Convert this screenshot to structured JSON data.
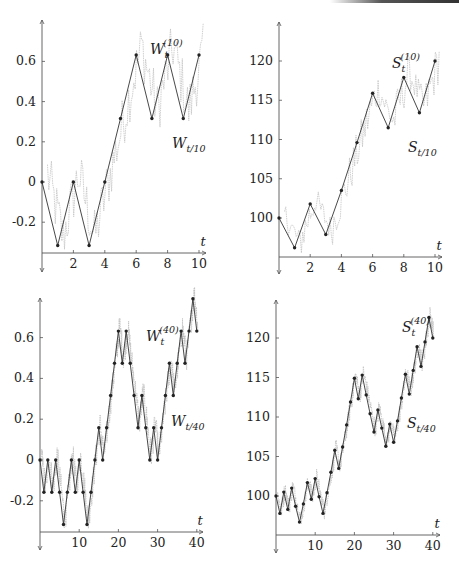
{
  "colors": {
    "axis": "#555555",
    "path": "#333333",
    "noise": "#bbbbbb",
    "marker": "#222222",
    "text": "#222222"
  },
  "chart_data": [
    {
      "id": "top-left",
      "type": "line",
      "title": "",
      "xlabel": "t",
      "ylabel": "",
      "xlim": [
        0,
        10
      ],
      "ylim": [
        -0.35,
        0.77
      ],
      "xticks": [
        2,
        4,
        6,
        8,
        10
      ],
      "xtick_labels": [
        "2",
        "4",
        "6",
        "8",
        "10"
      ],
      "yticks": [
        -0.2,
        0,
        0.2,
        0.4,
        0.6
      ],
      "ytick_labels": [
        "-0.2",
        "0",
        "0.2",
        "0.4",
        "0.6"
      ],
      "grid": false,
      "frame": {
        "x0": 42,
        "y0": 182,
        "xscale": 15.7,
        "yscale": 201,
        "axis_y": 253,
        "top": 20,
        "bottom": 272,
        "right": 206
      },
      "series": [
        {
          "name": "W_t^(10)",
          "label_main": "W",
          "label_sub": "t",
          "label_sup": "(10)",
          "label_pos": [
            150,
            54
          ],
          "x": [
            0,
            1,
            2,
            3,
            4,
            5,
            6,
            7,
            8,
            9,
            10
          ],
          "values": [
            0,
            -0.316,
            0,
            -0.316,
            0,
            0.316,
            0.632,
            0.316,
            0.632,
            0.316,
            0.632
          ]
        },
        {
          "name": "W_{t/10}",
          "label_main": "W",
          "label_sub": "t/10",
          "label_sup": "",
          "label_pos": [
            172,
            148
          ],
          "style": "noise"
        }
      ]
    },
    {
      "id": "top-right",
      "type": "line",
      "title": "",
      "xlabel": "t",
      "ylabel": "",
      "xlim": [
        0,
        10
      ],
      "ylim": [
        95,
        124
      ],
      "xticks": [
        2,
        4,
        6,
        8,
        10
      ],
      "xtick_labels": [
        "2",
        "4",
        "6",
        "8",
        "10"
      ],
      "yticks": [
        100,
        105,
        110,
        115,
        120
      ],
      "ytick_labels": [
        "100",
        "105",
        "110",
        "115",
        "120"
      ],
      "grid": false,
      "frame": {
        "x0": 279,
        "y0": 218,
        "xscale": 15.6,
        "yscale": 7.85,
        "axis_y": 257,
        "y_ref": 100,
        "top": 22,
        "bottom": 274,
        "right": 442
      },
      "series": [
        {
          "name": "S_t^(10)",
          "label_main": "S",
          "label_sub": "t",
          "label_sup": "(10)",
          "label_pos": [
            392,
            68
          ],
          "x": [
            0,
            1,
            2,
            3,
            4,
            5,
            6,
            7,
            8,
            9,
            10
          ],
          "values": [
            100,
            96.2,
            101.8,
            97.9,
            103.5,
            109.6,
            115.9,
            111.5,
            117.9,
            113.4,
            120
          ]
        },
        {
          "name": "S_{t/10}",
          "label_main": "S",
          "label_sub": "t/10",
          "label_sup": "",
          "label_pos": [
            408,
            152
          ],
          "style": "noise"
        }
      ]
    },
    {
      "id": "bottom-left",
      "type": "line",
      "title": "",
      "xlabel": "t",
      "ylabel": "",
      "xlim": [
        0,
        40
      ],
      "ylim": [
        -0.35,
        0.8
      ],
      "xticks": [
        10,
        20,
        30,
        40
      ],
      "xtick_labels": [
        "10",
        "20",
        "30",
        "40"
      ],
      "yticks": [
        -0.2,
        0,
        0.2,
        0.4,
        0.6
      ],
      "ytick_labels": [
        "-0.2",
        "0",
        "0.2",
        "0.4",
        "0.6"
      ],
      "grid": false,
      "frame": {
        "x0": 40,
        "y0": 460,
        "xscale": 3.92,
        "yscale": 204,
        "axis_y": 532,
        "top": 298,
        "bottom": 550,
        "right": 203
      },
      "series": [
        {
          "name": "W_t^(40)",
          "label_main": "W",
          "label_sub": "t",
          "label_sup": "(40)",
          "label_pos": [
            146,
            341
          ],
          "x": [
            0,
            1,
            2,
            3,
            4,
            5,
            6,
            7,
            8,
            9,
            10,
            11,
            12,
            13,
            14,
            15,
            16,
            17,
            18,
            19,
            20,
            21,
            22,
            23,
            24,
            25,
            26,
            27,
            28,
            29,
            30,
            31,
            32,
            33,
            34,
            35,
            36,
            37,
            38,
            39,
            40
          ],
          "values": [
            0,
            -0.158,
            0,
            -0.158,
            0,
            -0.158,
            -0.316,
            -0.158,
            0,
            -0.158,
            0,
            -0.158,
            -0.316,
            -0.158,
            0,
            0.158,
            0,
            0.158,
            0.316,
            0.474,
            0.632,
            0.474,
            0.632,
            0.474,
            0.316,
            0.158,
            0.316,
            0.158,
            0,
            0.158,
            0,
            0.158,
            0.316,
            0.474,
            0.316,
            0.474,
            0.632,
            0.474,
            0.632,
            0.79,
            0.632
          ]
        },
        {
          "name": "W_{t/40}",
          "label_main": "W",
          "label_sub": "t/40",
          "label_sup": "",
          "label_pos": [
            171,
            426
          ],
          "style": "noise"
        }
      ]
    },
    {
      "id": "bottom-right",
      "type": "line",
      "title": "",
      "xlabel": "t",
      "ylabel": "",
      "xlim": [
        0,
        40
      ],
      "ylim": [
        95,
        124
      ],
      "xticks": [
        10,
        20,
        30,
        40
      ],
      "xtick_labels": [
        "10",
        "20",
        "30",
        "40"
      ],
      "yticks": [
        100,
        105,
        110,
        115,
        120
      ],
      "ytick_labels": [
        "100",
        "105",
        "110",
        "115",
        "120"
      ],
      "grid": false,
      "frame": {
        "x0": 276,
        "y0": 496,
        "xscale": 3.92,
        "yscale": 7.9,
        "axis_y": 535,
        "y_ref": 100,
        "top": 300,
        "bottom": 553,
        "right": 440
      },
      "series": [
        {
          "name": "S_t^(40)",
          "label_main": "S",
          "label_sub": "t",
          "label_sup": "(40)",
          "label_pos": [
            402,
            332
          ],
          "x": [
            0,
            1,
            2,
            3,
            4,
            5,
            6,
            7,
            8,
            9,
            10,
            11,
            12,
            13,
            14,
            15,
            16,
            17,
            18,
            19,
            20,
            21,
            22,
            23,
            24,
            25,
            26,
            27,
            28,
            29,
            30,
            31,
            32,
            33,
            34,
            35,
            36,
            37,
            38,
            39,
            40
          ],
          "values": [
            100,
            97.8,
            100.5,
            98.3,
            101,
            98.7,
            96.7,
            99,
            101.7,
            99.6,
            102.2,
            99.9,
            97.8,
            100.4,
            103,
            105.8,
            103.5,
            106.2,
            109,
            111.9,
            114.9,
            112.3,
            115.3,
            112.8,
            110.4,
            108.1,
            110.9,
            108.6,
            106.3,
            109.1,
            106.8,
            109.5,
            112.4,
            115.4,
            112.9,
            115.9,
            118.9,
            116.4,
            119.5,
            122.6,
            120
          ]
        },
        {
          "name": "S_{t/40}",
          "label_main": "S",
          "label_sub": "t/40",
          "label_sup": "",
          "label_pos": [
            407,
            428
          ],
          "style": "noise"
        }
      ]
    }
  ]
}
